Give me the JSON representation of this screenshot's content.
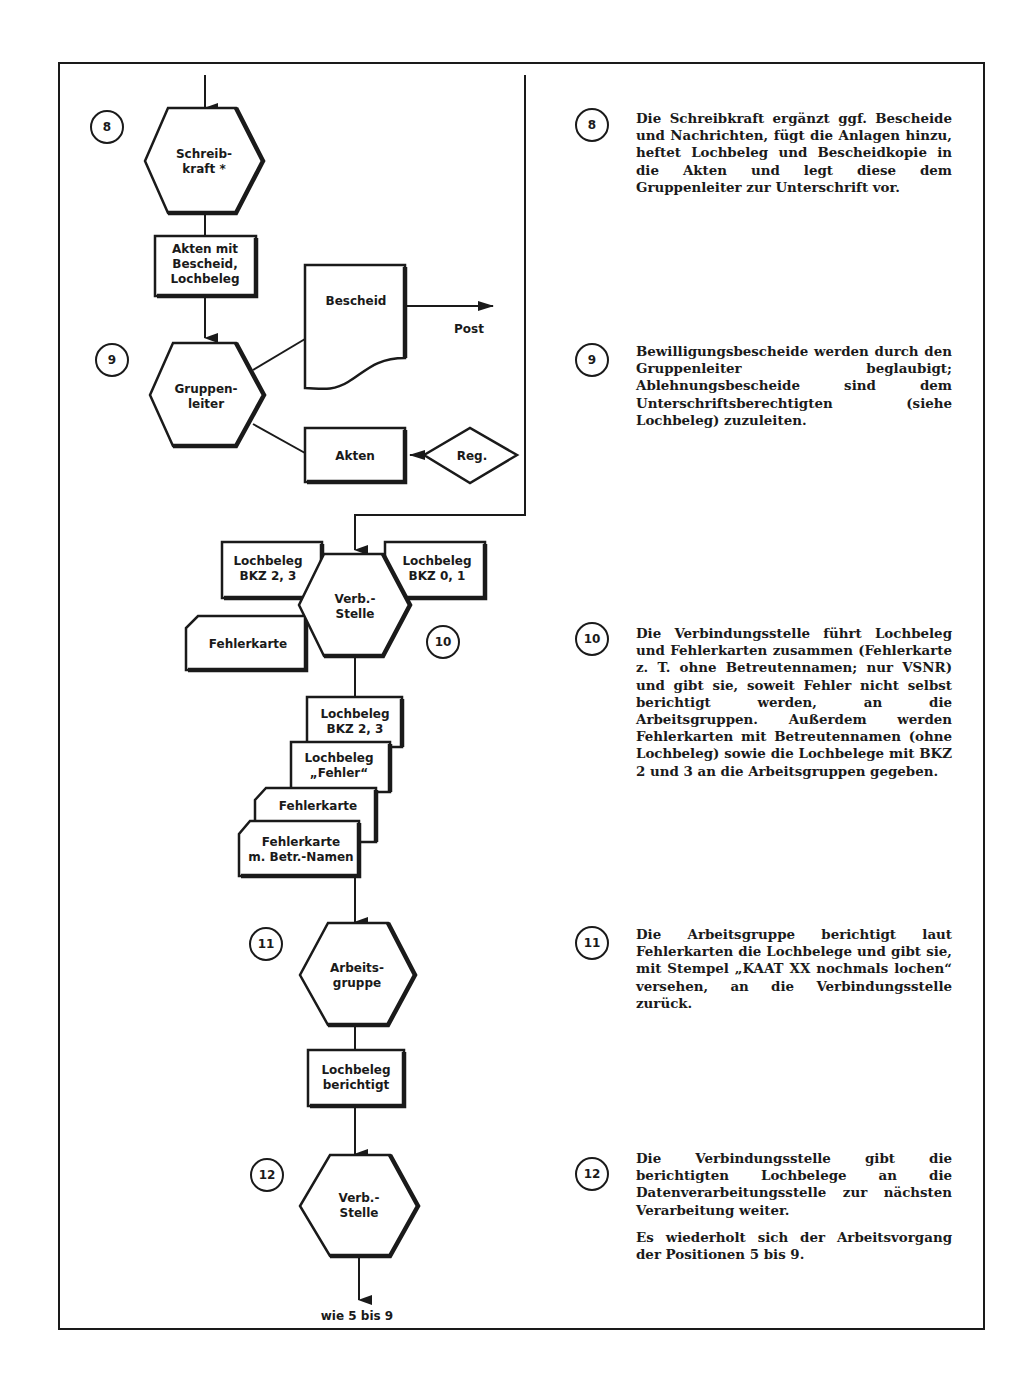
{
  "flowchart": {
    "steps": [
      {
        "number": "8",
        "actor": [
          "Schreib-",
          "kraft *"
        ]
      },
      {
        "number": "9",
        "actor": [
          "Gruppen-",
          "leiter"
        ]
      },
      {
        "number": "10",
        "actor": [
          "Verb.-",
          "Stelle"
        ]
      },
      {
        "number": "11",
        "actor": [
          "Arbeits-",
          "gruppe"
        ]
      },
      {
        "number": "12",
        "actor": [
          "Verb.-",
          "Stelle"
        ]
      }
    ],
    "documents": {
      "akten_bescheid": [
        "Akten mit",
        "Bescheid,",
        "Lochbeleg"
      ],
      "bescheid": "Bescheid",
      "post": "Post",
      "akten": "Akten",
      "reg": "Reg.",
      "lochbeleg_bkz23_left": [
        "Lochbeleg",
        "BKZ 2, 3"
      ],
      "lochbeleg_bkz01": [
        "Lochbeleg",
        "BKZ 0, 1"
      ],
      "fehlerkarte_left": "Fehlerkarte",
      "stack_lochbeleg_bkz23": [
        "Lochbeleg",
        "BKZ 2, 3"
      ],
      "stack_lochbeleg_fehler": [
        "Lochbeleg",
        "„Fehler“"
      ],
      "stack_fehlerkarte": "Fehlerkarte",
      "stack_fehlerkarte_namen": [
        "Fehlerkarte",
        "m. Betr.-Namen"
      ],
      "lochbeleg_berichtigt": [
        "Lochbeleg",
        "berichtigt"
      ]
    },
    "end_label": "wie 5 bis 9"
  },
  "descriptions": [
    {
      "number": "8",
      "paragraphs": [
        "Die Schreibkraft ergänzt ggf. Bescheide und Nachrichten, fügt die Anlagen hinzu, heftet Lochbeleg und Bescheidkopie in die Akten und legt diese dem Gruppenleiter zur Unterschrift vor."
      ]
    },
    {
      "number": "9",
      "paragraphs": [
        "Bewilligungsbescheide werden durch den Gruppenleiter beglaubigt; Ablehnungsbescheide sind dem Unterschriftsberechtigten (siehe Lochbeleg) zuzuleiten."
      ]
    },
    {
      "number": "10",
      "paragraphs": [
        "Die Verbindungsstelle führt Lochbeleg und Fehlerkarten zusammen (Fehlerkarte z. T. ohne Betreutennamen; nur VSNR) und gibt sie, soweit Fehler nicht selbst berichtigt werden, an die Arbeitsgruppen. Außerdem werden Fehlerkarten mit Betreutennamen (ohne Lochbeleg) sowie die Lochbelege mit BKZ 2 und 3 an die Arbeitsgruppen gegeben."
      ]
    },
    {
      "number": "11",
      "paragraphs": [
        "Die Arbeitsgruppe berichtigt laut Fehlerkarten die Lochbelege und gibt sie, mit Stempel „KAAT XX nochmals lochen“ versehen, an die Verbindungsstelle zurück."
      ]
    },
    {
      "number": "12",
      "paragraphs": [
        "Die Verbindungsstelle gibt die berichtigten Lochbelege an die Datenverarbeitungsstelle zur nächsten Verarbeitung weiter.",
        "Es wiederholt sich der Arbeitsvorgang der Positionen 5 bis 9."
      ]
    }
  ]
}
